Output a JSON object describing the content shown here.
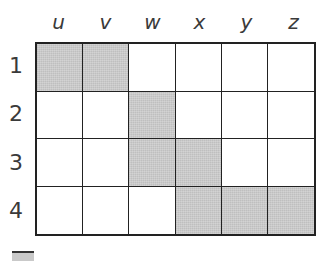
{
  "grid": {
    "columns": [
      "u",
      "v",
      "w",
      "x",
      "y",
      "z"
    ],
    "rows": [
      "1",
      "2",
      "3",
      "4"
    ],
    "shaded_color": "#c9c9c9",
    "line_color": "#222222",
    "cells": [
      [
        true,
        true,
        false,
        false,
        false,
        false
      ],
      [
        false,
        false,
        true,
        false,
        false,
        false
      ],
      [
        false,
        false,
        true,
        true,
        false,
        false
      ],
      [
        false,
        false,
        false,
        true,
        true,
        true
      ]
    ],
    "shaded_cells": [
      "u1",
      "v1",
      "w2",
      "w3",
      "x3",
      "x4",
      "y4",
      "z4"
    ]
  },
  "legend": {
    "swatch": "shaded-square (cut off)"
  }
}
